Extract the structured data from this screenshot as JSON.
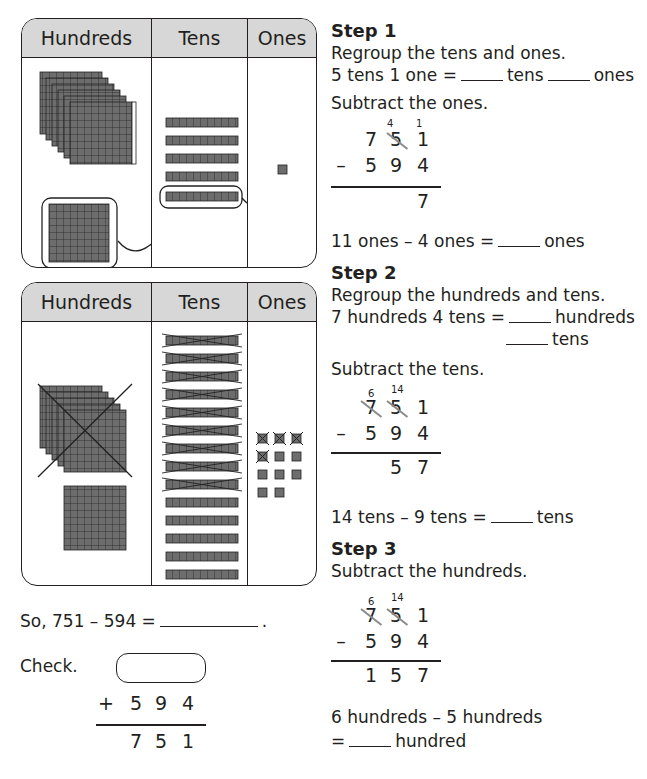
{
  "charts": [
    {
      "headers": [
        "Hundreds",
        "Tens",
        "Ones"
      ],
      "hundreds_flats": 7,
      "hundreds_circled": 1,
      "tens_rods": 5,
      "tens_circled": 1,
      "ones_cubes": 1
    },
    {
      "headers": [
        "Hundreds",
        "Tens",
        "Ones"
      ],
      "hundreds_flats": 6,
      "hundreds_crossed_out": 5,
      "tens_rods": 14,
      "tens_crossed_out": 9,
      "ones_cubes": 11,
      "ones_crossed_out": 4
    }
  ],
  "step1": {
    "title": "Step 1",
    "line1": "Regroup the tens and ones.",
    "line2_a": "5 tens 1 one =",
    "line2_b": "tens",
    "line2_c": "ones",
    "line3": "Subtract the ones.",
    "problem": {
      "top": [
        "7",
        "5",
        "1"
      ],
      "regroup_tens": "4",
      "regroup_ones": "1",
      "bottom": [
        "5",
        "9",
        "4"
      ],
      "operator": "–",
      "answer": [
        "",
        "",
        "7"
      ]
    },
    "line4_a": "11 ones – 4 ones =",
    "line4_b": "ones"
  },
  "step2": {
    "title": "Step 2",
    "line1": "Regroup the hundreds and tens.",
    "line2_a": "7 hundreds 4 tens =",
    "line2_b": "hundreds",
    "line2_c": "tens",
    "line3": "Subtract the tens.",
    "problem": {
      "top": [
        "7",
        "5",
        "1"
      ],
      "regroup_hundreds": "6",
      "regroup_tens": "14",
      "bottom": [
        "5",
        "9",
        "4"
      ],
      "operator": "–",
      "answer": [
        "",
        "5",
        "7"
      ]
    },
    "line4_a": "14 tens – 9 tens =",
    "line4_b": "tens"
  },
  "step3": {
    "title": "Step 3",
    "line1": "Subtract the hundreds.",
    "problem": {
      "top": [
        "7",
        "5",
        "1"
      ],
      "regroup_hundreds": "6",
      "regroup_tens": "14",
      "bottom": [
        "5",
        "9",
        "4"
      ],
      "operator": "–",
      "answer": [
        "1",
        "5",
        "7"
      ]
    },
    "line2": "6 hundreds – 5 hundreds",
    "line3_a": "=",
    "line3_b": "hundred"
  },
  "summary": {
    "so_text": "So, 751 – 594 =",
    "period": ".",
    "check_label": "Check.",
    "check_operator": "+",
    "check_addend": [
      "5",
      "9",
      "4"
    ],
    "check_sum": [
      "7",
      "5",
      "1"
    ]
  },
  "colors": {
    "block_fill": "#6d6d6d",
    "header_fill": "#d7d7d7",
    "strike_gray": "#8a8a8a"
  }
}
